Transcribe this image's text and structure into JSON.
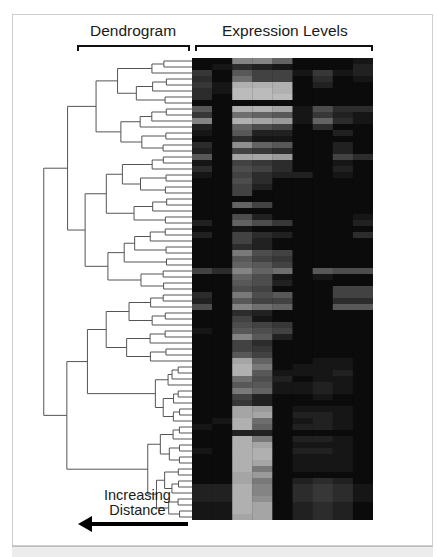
{
  "figure": {
    "dendrogram_title": "Dendrogram",
    "expression_title": "Expression Levels",
    "distance_label_line1": "Increasing",
    "distance_label_line2": "Distance",
    "arrow_direction": "left",
    "colors": {
      "background": "#ffffff",
      "frame_border": "#cfcfcf",
      "bottom_band": "#ececec",
      "dendrogram_lines": "#555555",
      "heatmap_low": "#000000",
      "heatmap_high": "#d8d8d8",
      "text": "#1a1a1a"
    }
  },
  "chart_data": {
    "type": "heatmap",
    "title": "Expression Levels",
    "left_annotation": "Dendrogram",
    "xlabel": "",
    "ylabel": "",
    "annotation": "Increasing Distance",
    "n_columns": 9,
    "n_rows": 77,
    "value_range": [
      0,
      1
    ],
    "colormap": "grayscale (black = low, light gray = high)",
    "rows": [
      [
        0.05,
        0.05,
        0.6,
        0.6,
        0.45,
        0.05,
        0.05,
        0.05,
        0.1
      ],
      [
        0.05,
        0.1,
        0.2,
        0.15,
        0.1,
        0.05,
        0.05,
        0.05,
        0.15
      ],
      [
        0.25,
        0.05,
        0.4,
        0.3,
        0.3,
        0.1,
        0.25,
        0.1,
        0.15
      ],
      [
        0.2,
        0.05,
        0.5,
        0.3,
        0.3,
        0.05,
        0.2,
        0.05,
        0.1
      ],
      [
        0.25,
        0.1,
        0.8,
        0.8,
        0.8,
        0.05,
        0.15,
        0.05,
        0.05
      ],
      [
        0.2,
        0.1,
        0.85,
        0.85,
        0.8,
        0.05,
        0.05,
        0.05,
        0.05
      ],
      [
        0.2,
        0.05,
        0.85,
        0.85,
        0.85,
        0.05,
        0.05,
        0.05,
        0.05
      ],
      [
        0.05,
        0.05,
        0.05,
        0.05,
        0.05,
        0.05,
        0.05,
        0.05,
        0.05
      ],
      [
        0.4,
        0.05,
        0.8,
        0.8,
        0.75,
        0.1,
        0.35,
        0.2,
        0.2
      ],
      [
        0.25,
        0.05,
        0.5,
        0.45,
        0.4,
        0.1,
        0.25,
        0.15,
        0.1
      ],
      [
        0.6,
        0.05,
        0.8,
        0.75,
        0.7,
        0.1,
        0.45,
        0.2,
        0.1
      ],
      [
        0.15,
        0.05,
        0.45,
        0.35,
        0.3,
        0.05,
        0.2,
        0.05,
        0.05
      ],
      [
        0.1,
        0.05,
        0.4,
        0.15,
        0.15,
        0.05,
        0.05,
        0.15,
        0.05
      ],
      [
        0.05,
        0.05,
        0.2,
        0.1,
        0.1,
        0.05,
        0.05,
        0.05,
        0.05
      ],
      [
        0.2,
        0.05,
        0.65,
        0.45,
        0.4,
        0.05,
        0.05,
        0.15,
        0.05
      ],
      [
        0.15,
        0.05,
        0.3,
        0.25,
        0.2,
        0.05,
        0.05,
        0.15,
        0.05
      ],
      [
        0.4,
        0.05,
        0.75,
        0.75,
        0.7,
        0.05,
        0.05,
        0.3,
        0.2
      ],
      [
        0.1,
        0.05,
        0.3,
        0.25,
        0.2,
        0.05,
        0.05,
        0.1,
        0.05
      ],
      [
        0.2,
        0.05,
        0.35,
        0.3,
        0.2,
        0.05,
        0.05,
        0.15,
        0.05
      ],
      [
        0.1,
        0.05,
        0.3,
        0.2,
        0.15,
        0.15,
        0.05,
        0.1,
        0.05
      ],
      [
        0.05,
        0.05,
        0.35,
        0.2,
        0.05,
        0.05,
        0.05,
        0.05,
        0.05
      ],
      [
        0.05,
        0.05,
        0.3,
        0.15,
        0.05,
        0.05,
        0.05,
        0.05,
        0.05
      ],
      [
        0.05,
        0.05,
        0.3,
        0.05,
        0.05,
        0.05,
        0.05,
        0.05,
        0.05
      ],
      [
        0.05,
        0.05,
        0.05,
        0.05,
        0.05,
        0.05,
        0.05,
        0.05,
        0.05
      ],
      [
        0.05,
        0.05,
        0.45,
        0.3,
        0.05,
        0.05,
        0.05,
        0.05,
        0.05
      ],
      [
        0.05,
        0.05,
        0.05,
        0.05,
        0.05,
        0.05,
        0.05,
        0.05,
        0.05
      ],
      [
        0.05,
        0.05,
        0.35,
        0.15,
        0.05,
        0.05,
        0.05,
        0.05,
        0.1
      ],
      [
        0.15,
        0.05,
        0.45,
        0.35,
        0.25,
        0.05,
        0.05,
        0.05,
        0.15
      ],
      [
        0.05,
        0.05,
        0.1,
        0.05,
        0.05,
        0.05,
        0.05,
        0.05,
        0.05
      ],
      [
        0.15,
        0.05,
        0.3,
        0.2,
        0.15,
        0.05,
        0.05,
        0.05,
        0.2
      ],
      [
        0.05,
        0.05,
        0.3,
        0.15,
        0.05,
        0.05,
        0.05,
        0.05,
        0.05
      ],
      [
        0.05,
        0.05,
        0.2,
        0.15,
        0.05,
        0.05,
        0.05,
        0.05,
        0.05
      ],
      [
        0.05,
        0.05,
        0.55,
        0.35,
        0.3,
        0.05,
        0.05,
        0.05,
        0.05
      ],
      [
        0.05,
        0.05,
        0.4,
        0.3,
        0.25,
        0.05,
        0.05,
        0.05,
        0.05
      ],
      [
        0.05,
        0.05,
        0.45,
        0.4,
        0.3,
        0.05,
        0.05,
        0.05,
        0.05
      ],
      [
        0.3,
        0.2,
        0.6,
        0.45,
        0.5,
        0.05,
        0.4,
        0.35,
        0.35
      ],
      [
        0.05,
        0.05,
        0.45,
        0.35,
        0.1,
        0.05,
        0.1,
        0.05,
        0.05
      ],
      [
        0.05,
        0.05,
        0.4,
        0.35,
        0.15,
        0.05,
        0.05,
        0.05,
        0.05
      ],
      [
        0.05,
        0.05,
        0.35,
        0.3,
        0.05,
        0.05,
        0.05,
        0.3,
        0.3
      ],
      [
        0.2,
        0.05,
        0.55,
        0.35,
        0.4,
        0.05,
        0.05,
        0.3,
        0.3
      ],
      [
        0.15,
        0.05,
        0.4,
        0.3,
        0.3,
        0.05,
        0.05,
        0.2,
        0.2
      ],
      [
        0.35,
        0.05,
        0.6,
        0.5,
        0.45,
        0.05,
        0.05,
        0.4,
        0.4
      ],
      [
        0.05,
        0.05,
        0.2,
        0.15,
        0.05,
        0.05,
        0.05,
        0.05,
        0.05
      ],
      [
        0.05,
        0.05,
        0.3,
        0.1,
        0.05,
        0.05,
        0.05,
        0.05,
        0.05
      ],
      [
        0.05,
        0.05,
        0.35,
        0.3,
        0.25,
        0.05,
        0.05,
        0.05,
        0.05
      ],
      [
        0.1,
        0.05,
        0.4,
        0.35,
        0.3,
        0.05,
        0.05,
        0.05,
        0.05
      ],
      [
        0.05,
        0.05,
        0.6,
        0.4,
        0.15,
        0.05,
        0.05,
        0.05,
        0.05
      ],
      [
        0.05,
        0.05,
        0.3,
        0.2,
        0.05,
        0.05,
        0.05,
        0.05,
        0.05
      ],
      [
        0.05,
        0.05,
        0.3,
        0.25,
        0.05,
        0.05,
        0.05,
        0.05,
        0.05
      ],
      [
        0.05,
        0.05,
        0.4,
        0.3,
        0.05,
        0.05,
        0.05,
        0.05,
        0.05
      ],
      [
        0.05,
        0.05,
        0.75,
        0.45,
        0.05,
        0.05,
        0.1,
        0.1,
        0.05
      ],
      [
        0.05,
        0.05,
        0.8,
        0.55,
        0.05,
        0.1,
        0.1,
        0.1,
        0.05
      ],
      [
        0.05,
        0.05,
        0.8,
        0.4,
        0.1,
        0.1,
        0.1,
        0.15,
        0.05
      ],
      [
        0.05,
        0.05,
        0.5,
        0.35,
        0.15,
        0.05,
        0.1,
        0.1,
        0.05
      ],
      [
        0.05,
        0.05,
        0.4,
        0.4,
        0.1,
        0.1,
        0.15,
        0.1,
        0.05
      ],
      [
        0.05,
        0.05,
        0.55,
        0.45,
        0.1,
        0.1,
        0.15,
        0.1,
        0.05
      ],
      [
        0.05,
        0.05,
        0.3,
        0.15,
        0.05,
        0.05,
        0.1,
        0.05,
        0.05
      ],
      [
        0.05,
        0.05,
        0.25,
        0.15,
        0.05,
        0.05,
        0.05,
        0.05,
        0.05
      ],
      [
        0.05,
        0.05,
        0.75,
        0.7,
        0.05,
        0.1,
        0.1,
        0.1,
        0.05
      ],
      [
        0.05,
        0.05,
        0.75,
        0.75,
        0.05,
        0.15,
        0.15,
        0.1,
        0.05
      ],
      [
        0.05,
        0.1,
        0.8,
        0.5,
        0.05,
        0.1,
        0.15,
        0.1,
        0.05
      ],
      [
        0.1,
        0.05,
        0.8,
        0.45,
        0.05,
        0.15,
        0.15,
        0.1,
        0.05
      ],
      [
        0.05,
        0.05,
        0.15,
        0.15,
        0.05,
        0.05,
        0.05,
        0.05,
        0.05
      ],
      [
        0.05,
        0.05,
        0.8,
        0.55,
        0.05,
        0.15,
        0.15,
        0.1,
        0.05
      ],
      [
        0.05,
        0.05,
        0.8,
        0.75,
        0.05,
        0.1,
        0.1,
        0.1,
        0.05
      ],
      [
        0.1,
        0.05,
        0.8,
        0.8,
        0.05,
        0.15,
        0.15,
        0.1,
        0.05
      ],
      [
        0.05,
        0.05,
        0.8,
        0.8,
        0.05,
        0.1,
        0.1,
        0.1,
        0.05
      ],
      [
        0.05,
        0.05,
        0.8,
        0.75,
        0.05,
        0.1,
        0.1,
        0.1,
        0.05
      ],
      [
        0.05,
        0.05,
        0.8,
        0.55,
        0.05,
        0.1,
        0.1,
        0.1,
        0.05
      ],
      [
        0.05,
        0.05,
        0.75,
        0.7,
        0.05,
        0.05,
        0.05,
        0.05,
        0.05
      ],
      [
        0.05,
        0.05,
        0.75,
        0.55,
        0.05,
        0.15,
        0.2,
        0.15,
        0.05
      ],
      [
        0.15,
        0.15,
        0.8,
        0.6,
        0.05,
        0.2,
        0.25,
        0.2,
        0.1
      ],
      [
        0.15,
        0.15,
        0.8,
        0.6,
        0.05,
        0.2,
        0.25,
        0.2,
        0.1
      ],
      [
        0.15,
        0.15,
        0.8,
        0.65,
        0.05,
        0.2,
        0.25,
        0.2,
        0.1
      ],
      [
        0.1,
        0.1,
        0.8,
        0.75,
        0.05,
        0.15,
        0.2,
        0.15,
        0.05
      ],
      [
        0.1,
        0.1,
        0.8,
        0.75,
        0.05,
        0.15,
        0.2,
        0.15,
        0.05
      ],
      [
        0.1,
        0.1,
        0.75,
        0.75,
        0.05,
        0.15,
        0.2,
        0.15,
        0.05
      ]
    ],
    "dendrogram": {
      "orientation": "left",
      "leaf_count": 77,
      "note": "Hierarchical clustering tree aligned to heatmap rows; root on the left, leaves on the right"
    }
  }
}
